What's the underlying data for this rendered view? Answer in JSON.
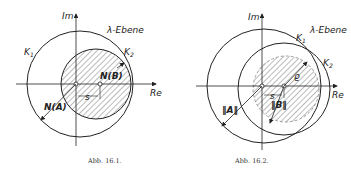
{
  "figures": [
    {
      "caption": "Abb. 16.1.",
      "plane_label": "λ-Ebene",
      "axis_im": "Im",
      "axis_re": "Re",
      "circle_k1": "K",
      "circle_k1_sub": "1",
      "circle_k2": "K",
      "circle_k2_sub": "2",
      "label_a": "N(A)",
      "label_b": "N(B)",
      "label_s": "s"
    },
    {
      "caption": "Abb. 16.2.",
      "plane_label": "λ-Ebene",
      "axis_im": "Im",
      "axis_re": "Re",
      "circle_k1": "K",
      "circle_k1_sub": "1",
      "circle_k2": "K",
      "circle_k2_sub": "2",
      "label_a": "‖A‖",
      "label_b": "‖B‖",
      "label_s": "s",
      "label_rho": "ϱ"
    }
  ]
}
